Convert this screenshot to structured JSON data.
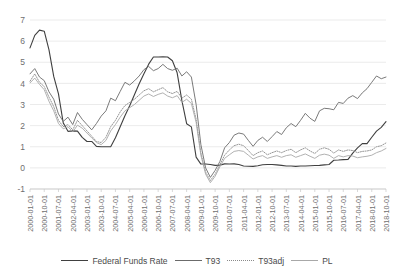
{
  "chart_data": {
    "type": "line",
    "title": "",
    "xlabel": "",
    "ylabel": "",
    "ylim": [
      -1,
      7
    ],
    "yticks": [
      -1,
      0,
      1,
      2,
      3,
      4,
      5,
      6,
      7
    ],
    "ytick_labels": [
      "-1",
      "0",
      "1",
      "2",
      "3",
      "4",
      "5",
      "6",
      "7"
    ],
    "grid": "horizontal",
    "legend_position": "bottom",
    "xtick_labels": [
      "2000-01-01",
      "2000-10-01",
      "2001-07-01",
      "2002-04-01",
      "2003-01-01",
      "2003-10-01",
      "2004-07-01",
      "2005-04-01",
      "2006-01-01",
      "2006-10-01",
      "2007-07-01",
      "2008-04-01",
      "2009-01-01",
      "2009-10-01",
      "2010-07-01",
      "2011-04-01",
      "2012-01-01",
      "2012-10-01",
      "2013-07-01",
      "2014-04-01",
      "2015-01-01",
      "2015-10-01",
      "2016-07-01",
      "2017-04-01",
      "2018-01-01",
      "2018-10-01"
    ],
    "x": [
      "2000-01-01",
      "2000-04-01",
      "2000-07-01",
      "2000-10-01",
      "2001-01-01",
      "2001-04-01",
      "2001-07-01",
      "2001-10-01",
      "2002-01-01",
      "2002-04-01",
      "2002-07-01",
      "2002-10-01",
      "2003-01-01",
      "2003-04-01",
      "2003-07-01",
      "2003-10-01",
      "2004-01-01",
      "2004-04-01",
      "2004-07-01",
      "2004-10-01",
      "2005-01-01",
      "2005-04-01",
      "2005-07-01",
      "2005-10-01",
      "2006-01-01",
      "2006-04-01",
      "2006-07-01",
      "2006-10-01",
      "2007-01-01",
      "2007-04-01",
      "2007-07-01",
      "2007-10-01",
      "2008-01-01",
      "2008-04-01",
      "2008-07-01",
      "2008-10-01",
      "2009-01-01",
      "2009-04-01",
      "2009-07-01",
      "2009-10-01",
      "2010-01-01",
      "2010-04-01",
      "2010-07-01",
      "2010-10-01",
      "2011-01-01",
      "2011-04-01",
      "2011-07-01",
      "2011-10-01",
      "2012-01-01",
      "2012-04-01",
      "2012-07-01",
      "2012-10-01",
      "2013-01-01",
      "2013-04-01",
      "2013-07-01",
      "2013-10-01",
      "2014-01-01",
      "2014-04-01",
      "2014-07-01",
      "2014-10-01",
      "2015-01-01",
      "2015-04-01",
      "2015-07-01",
      "2015-10-01",
      "2016-01-01",
      "2016-04-01",
      "2016-07-01",
      "2016-10-01",
      "2017-01-01",
      "2017-04-01",
      "2017-07-01",
      "2017-10-01",
      "2018-01-01",
      "2018-04-01",
      "2018-07-01",
      "2018-10-01"
    ],
    "series": [
      {
        "name": "Federal Funds Rate",
        "color": "#404040",
        "style": "solid",
        "width": 1.1,
        "values": [
          5.68,
          6.27,
          6.52,
          6.47,
          5.59,
          4.33,
          3.5,
          2.13,
          1.73,
          1.75,
          1.74,
          1.44,
          1.25,
          1.25,
          1.02,
          1.0,
          1.0,
          1.0,
          1.43,
          1.95,
          2.47,
          2.94,
          3.46,
          3.98,
          4.46,
          4.91,
          5.25,
          5.25,
          5.26,
          5.25,
          5.07,
          4.5,
          3.18,
          2.09,
          1.94,
          0.51,
          0.18,
          0.18,
          0.16,
          0.12,
          0.13,
          0.19,
          0.18,
          0.19,
          0.16,
          0.09,
          0.08,
          0.07,
          0.1,
          0.15,
          0.16,
          0.16,
          0.14,
          0.12,
          0.09,
          0.09,
          0.07,
          0.09,
          0.09,
          0.1,
          0.11,
          0.12,
          0.14,
          0.16,
          0.36,
          0.37,
          0.39,
          0.4,
          0.7,
          0.95,
          1.15,
          1.15,
          1.45,
          1.74,
          1.92,
          2.19
        ]
      },
      {
        "name": "T93",
        "color": "#6b6b6b",
        "style": "solid",
        "width": 0.9,
        "values": [
          4.45,
          4.7,
          4.3,
          4.13,
          3.6,
          3.25,
          2.55,
          2.2,
          2.4,
          2.05,
          2.62,
          2.3,
          2.05,
          1.8,
          2.1,
          2.45,
          2.7,
          3.3,
          3.18,
          3.62,
          4.05,
          3.92,
          4.12,
          4.35,
          4.65,
          4.8,
          4.6,
          4.7,
          4.9,
          4.7,
          4.62,
          4.72,
          4.35,
          4.55,
          4.3,
          3.0,
          1.1,
          0.0,
          -0.45,
          -0.12,
          0.3,
          0.95,
          1.2,
          1.55,
          1.65,
          1.6,
          1.3,
          1.02,
          1.3,
          1.45,
          1.25,
          1.48,
          1.72,
          1.58,
          1.9,
          2.1,
          1.95,
          2.25,
          2.58,
          2.35,
          2.2,
          2.7,
          2.82,
          2.8,
          2.75,
          3.1,
          3.05,
          3.3,
          3.42,
          3.28,
          3.55,
          3.75,
          4.05,
          4.35,
          4.22,
          4.3
        ]
      },
      {
        "name": "T93adj",
        "color": "#8a8a8a",
        "style": "dotted",
        "width": 0.9,
        "values": [
          4.1,
          4.45,
          4.05,
          3.85,
          3.35,
          2.9,
          2.25,
          1.95,
          2.05,
          1.8,
          2.25,
          2.0,
          1.75,
          1.5,
          1.25,
          1.2,
          1.45,
          1.95,
          2.25,
          2.65,
          2.95,
          3.1,
          3.25,
          3.45,
          3.65,
          3.75,
          3.6,
          3.7,
          3.8,
          3.6,
          3.52,
          3.62,
          3.3,
          3.45,
          3.25,
          2.3,
          0.7,
          -0.2,
          -0.6,
          -0.3,
          0.15,
          0.6,
          0.85,
          1.05,
          1.12,
          1.05,
          0.82,
          0.58,
          0.72,
          0.8,
          0.62,
          0.72,
          0.8,
          0.72,
          0.82,
          0.88,
          0.72,
          0.85,
          0.95,
          0.8,
          0.68,
          0.88,
          0.95,
          0.88,
          0.7,
          0.85,
          0.78,
          0.85,
          0.82,
          0.72,
          0.78,
          0.8,
          0.85,
          1.0,
          1.05,
          1.18
        ]
      },
      {
        "name": "PL",
        "color": "#a8a8a8",
        "style": "solid",
        "width": 0.9,
        "values": [
          4.02,
          4.25,
          3.95,
          3.7,
          3.15,
          2.7,
          2.1,
          1.85,
          1.95,
          1.7,
          2.02,
          1.88,
          1.65,
          1.42,
          1.2,
          1.1,
          1.3,
          1.75,
          2.05,
          2.4,
          2.7,
          2.85,
          3.0,
          3.2,
          3.4,
          3.5,
          3.38,
          3.48,
          3.55,
          3.4,
          3.32,
          3.42,
          3.1,
          3.25,
          3.05,
          2.15,
          0.6,
          -0.3,
          -0.7,
          -0.4,
          0.05,
          0.45,
          0.62,
          0.78,
          0.82,
          0.78,
          0.6,
          0.42,
          0.52,
          0.58,
          0.45,
          0.52,
          0.58,
          0.5,
          0.58,
          0.62,
          0.5,
          0.58,
          0.66,
          0.55,
          0.45,
          0.6,
          0.65,
          0.6,
          0.45,
          0.58,
          0.52,
          0.58,
          0.56,
          0.48,
          0.52,
          0.55,
          0.6,
          0.72,
          0.8,
          0.92
        ]
      }
    ]
  },
  "legend": {
    "entries": [
      {
        "label": "Federal Funds Rate"
      },
      {
        "label": "T93"
      },
      {
        "label": "T93adj"
      },
      {
        "label": "PL"
      }
    ]
  }
}
